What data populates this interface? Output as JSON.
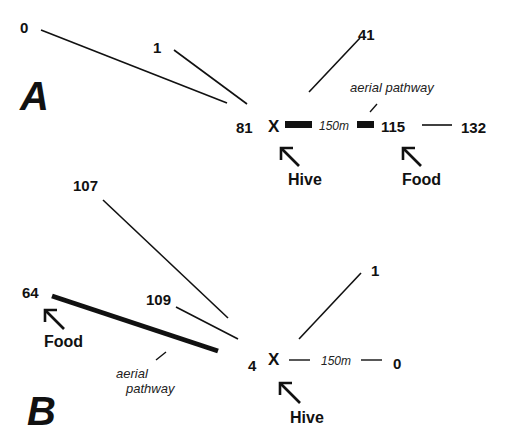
{
  "panels": {
    "A": {
      "label": "A",
      "hive_marker": "X",
      "hive_label": "Hive",
      "food_label": "Food",
      "distance_label": "150m",
      "pathway_label": "aerial pathway",
      "counts": {
        "north_west_far": "0",
        "north_west_near": "1",
        "north_east": "41",
        "hive": "81",
        "food": "115",
        "beyond_food": "132"
      }
    },
    "B": {
      "label": "B",
      "hive_marker": "X",
      "hive_label": "Hive",
      "food_label": "Food",
      "distance_label": "150m",
      "pathway_label_line1": "aerial",
      "pathway_label_line2": "pathway",
      "counts": {
        "north_west_far": "107",
        "north_west_near": "109",
        "food": "64",
        "north_east": "1",
        "hive": "4",
        "east": "0"
      }
    }
  }
}
